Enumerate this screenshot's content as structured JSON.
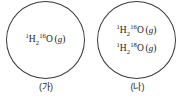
{
  "diagram": {
    "type": "chemistry-container-diagram",
    "background_color": "#ffffff",
    "stroke_color": "#3b3b3b",
    "text_color": "#1a1a1a",
    "panels": [
      {
        "id": "a",
        "caption": "(가)",
        "species": [
          {
            "mass_number_h": "1",
            "element_h": "H",
            "count_h": "2",
            "mass_number_o": "16",
            "element_o": "O",
            "state_open": "(",
            "state": "g",
            "state_close": ")"
          }
        ]
      },
      {
        "id": "b",
        "caption": "(나)",
        "species": [
          {
            "mass_number_h": "1",
            "element_h": "H",
            "count_h": "2",
            "mass_number_o": "16",
            "element_o": "O",
            "state_open": "(",
            "state": "g",
            "state_close": ")"
          },
          {
            "mass_number_h": "1",
            "element_h": "H",
            "count_h": "2",
            "mass_number_o": "18",
            "element_o": "O",
            "state_open": "(",
            "state": "g",
            "state_close": ")"
          }
        ]
      }
    ]
  }
}
